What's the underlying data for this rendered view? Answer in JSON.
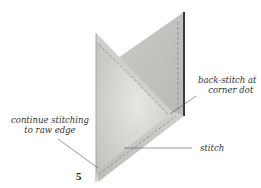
{
  "diagram": {
    "step_number": "5",
    "labels": {
      "backstitch_line1": "back-stitch at",
      "backstitch_line2": "corner dot",
      "continue_line1": "continue stitching",
      "continue_line2": "to raw edge",
      "stitch": "stitch"
    },
    "colors": {
      "fabric_light": "#d6d6d2",
      "fabric_mid": "#c4c4c0",
      "fabric_dark": "#b0b0ac",
      "edge_dark": "#3a3a3a",
      "stitch_line": "#7a7a7a",
      "leader_line": "#555555"
    }
  }
}
